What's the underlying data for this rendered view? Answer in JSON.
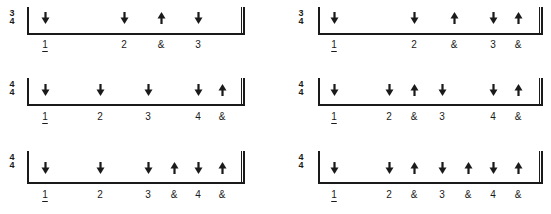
{
  "figure": {
    "measures": [
      {
        "id": "row1-left",
        "time_signature": {
          "top": "3",
          "bottom": "4"
        },
        "beats": [
          {
            "label": "1",
            "stroke": "down",
            "x": 45,
            "first": true
          },
          {
            "label": "2",
            "stroke": "down",
            "x": 124
          },
          {
            "label": "&",
            "stroke": "up",
            "x": 161
          },
          {
            "label": "3",
            "stroke": "down",
            "x": 198
          }
        ]
      },
      {
        "id": "row1-right",
        "time_signature": {
          "top": "3",
          "bottom": "4"
        },
        "beats": [
          {
            "label": "1",
            "stroke": "down",
            "x": 334,
            "first": true
          },
          {
            "label": "2",
            "stroke": "down",
            "x": 414
          },
          {
            "label": "&",
            "stroke": "up",
            "x": 454
          },
          {
            "label": "3",
            "stroke": "down",
            "x": 493
          },
          {
            "label": "&",
            "stroke": "up",
            "x": 518
          }
        ]
      },
      {
        "id": "row2-left",
        "time_signature": {
          "top": "4",
          "bottom": "4"
        },
        "beats": [
          {
            "label": "1",
            "stroke": "down",
            "x": 45,
            "first": true
          },
          {
            "label": "2",
            "stroke": "down",
            "x": 100
          },
          {
            "label": "3",
            "stroke": "down",
            "x": 148
          },
          {
            "label": "4",
            "stroke": "down",
            "x": 198
          },
          {
            "label": "&",
            "stroke": "up",
            "x": 222
          }
        ]
      },
      {
        "id": "row2-right",
        "time_signature": {
          "top": "4",
          "bottom": "4"
        },
        "beats": [
          {
            "label": "1",
            "stroke": "down",
            "x": 334,
            "first": true
          },
          {
            "label": "2",
            "stroke": "down",
            "x": 389
          },
          {
            "label": "&",
            "stroke": "up",
            "x": 414
          },
          {
            "label": "3",
            "stroke": "down",
            "x": 442
          },
          {
            "label": "4",
            "stroke": "down",
            "x": 493
          },
          {
            "label": "&",
            "stroke": "up",
            "x": 518
          }
        ]
      },
      {
        "id": "row3-left",
        "time_signature": {
          "top": "4",
          "bottom": "4"
        },
        "beats": [
          {
            "label": "1",
            "stroke": "down",
            "x": 45,
            "first": true
          },
          {
            "label": "2",
            "stroke": "down",
            "x": 100
          },
          {
            "label": "3",
            "stroke": "down",
            "x": 148
          },
          {
            "label": "&",
            "stroke": "up",
            "x": 174
          },
          {
            "label": "4",
            "stroke": "down",
            "x": 198
          },
          {
            "label": "&",
            "stroke": "up",
            "x": 222
          }
        ]
      },
      {
        "id": "row3-right",
        "time_signature": {
          "top": "4",
          "bottom": "4"
        },
        "beats": [
          {
            "label": "1",
            "stroke": "down",
            "x": 334,
            "first": true
          },
          {
            "label": "2",
            "stroke": "down",
            "x": 389
          },
          {
            "label": "&",
            "stroke": "up",
            "x": 414
          },
          {
            "label": "3",
            "stroke": "down",
            "x": 442
          },
          {
            "label": "&",
            "stroke": "up",
            "x": 468
          },
          {
            "label": "4",
            "stroke": "down",
            "x": 493
          },
          {
            "label": "&",
            "stroke": "up",
            "x": 518
          }
        ]
      }
    ],
    "colors": {
      "ink": "#1a1a1a",
      "background": "#ffffff"
    }
  }
}
